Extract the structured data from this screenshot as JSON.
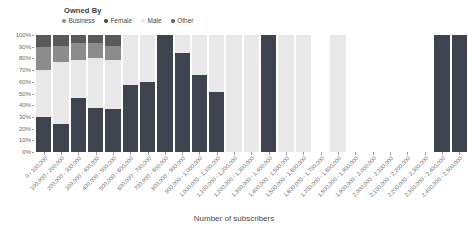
{
  "legend": {
    "title": "Owned By",
    "items": [
      {
        "label": "Business",
        "color": "#8c8c8c"
      },
      {
        "label": "Female",
        "color": "#3f4350"
      },
      {
        "label": "Male",
        "color": "#e8e8e8"
      },
      {
        "label": "Other",
        "color": "#5a5a5a"
      }
    ]
  },
  "axes": {
    "y_title": "Count",
    "x_title": "Number of subscribers",
    "y_ticks": [
      "100%",
      "90%",
      "80%",
      "70%",
      "60%",
      "50%",
      "40%",
      "30%",
      "20%",
      "10%",
      "0%"
    ],
    "y_min": 0,
    "y_max": 100
  },
  "chart_data": {
    "type": "bar",
    "title": "",
    "subtitle": "",
    "xlabel": "Number of subscribers",
    "ylabel": "Count",
    "ylim": [
      0,
      100
    ],
    "grid": false,
    "stacked": true,
    "normalized_percent": true,
    "legend_position": "top-left",
    "legend_title": "Owned By",
    "series": [
      {
        "name": "Female",
        "color": "#3f4350",
        "values": [
          30,
          24,
          46,
          38,
          37,
          57,
          60,
          100,
          85,
          66,
          51,
          0,
          0,
          100,
          0,
          0,
          0,
          0,
          0,
          0,
          0,
          0,
          0,
          100,
          100
        ]
      },
      {
        "name": "Male",
        "color": "#e8e8e8",
        "values": [
          40,
          53,
          33,
          42,
          42,
          43,
          40,
          0,
          15,
          34,
          49,
          100,
          100,
          0,
          100,
          100,
          0,
          100,
          0,
          0,
          0,
          0,
          0,
          0,
          0
        ]
      },
      {
        "name": "Business",
        "color": "#8c8c8c",
        "values": [
          20,
          14,
          14,
          13,
          12,
          0,
          0,
          0,
          0,
          0,
          0,
          0,
          0,
          0,
          0,
          0,
          0,
          0,
          0,
          0,
          0,
          0,
          0,
          0,
          0
        ]
      },
      {
        "name": "Other",
        "color": "#5a5a5a",
        "values": [
          10,
          9,
          7,
          7,
          9,
          0,
          0,
          0,
          0,
          0,
          0,
          0,
          0,
          0,
          0,
          0,
          0,
          0,
          0,
          0,
          0,
          0,
          0,
          0,
          0
        ]
      }
    ],
    "categories": [
      "0 - 100,000",
      "100,000 - 200,000",
      "200,000 - 300,000",
      "300,000 - 400,000",
      "400,000 - 500,000",
      "500,000 - 600,000",
      "600,000 - 700,000",
      "700,000 - 800,000",
      "800,000 - 900,000",
      "900,000 - 1,000,000",
      "1,000,000 - 1,100,000",
      "1,100,000 - 1,200,000",
      "1,200,000 - 1,300,000",
      "1,300,000 - 1,400,000",
      "1,400,000 - 1,500,000",
      "1,500,000 - 1,600,000",
      "1,600,000 - 1,700,000",
      "1,700,000 - 1,800,000",
      "1,800,000 - 1,900,000",
      "1,900,000 - 2,000,000",
      "2,000,000 - 2,100,000",
      "2,100,000 - 2,200,000",
      "2,200,000 - 2,300,000",
      "2,300,000 - 2,400,000",
      "2,400,000 - 2,500,000"
    ],
    "bars_present": [
      true,
      true,
      true,
      true,
      true,
      true,
      true,
      true,
      true,
      true,
      true,
      true,
      true,
      true,
      true,
      true,
      false,
      true,
      false,
      false,
      false,
      false,
      false,
      true,
      true
    ]
  }
}
